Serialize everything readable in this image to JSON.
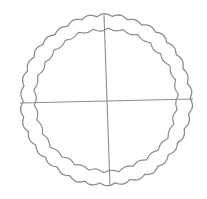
{
  "drawing": {
    "subject": "Scalloped circle divided into four quadrants",
    "stroke_color": "#8c8c8c",
    "background": "#ffffff",
    "circle": {
      "cx": 106,
      "cy": 100,
      "outer_radius": 86,
      "inner_radius": 75,
      "outer_scallops": 34,
      "inner_scallops": 30,
      "scallop_depth": 2.6
    },
    "lines": [
      {
        "name": "vertical-divider",
        "x1": 104,
        "y1": 15,
        "x2": 110,
        "y2": 186
      },
      {
        "name": "horizontal-divider",
        "x1": 20,
        "y1": 103,
        "x2": 193,
        "y2": 99
      }
    ]
  }
}
